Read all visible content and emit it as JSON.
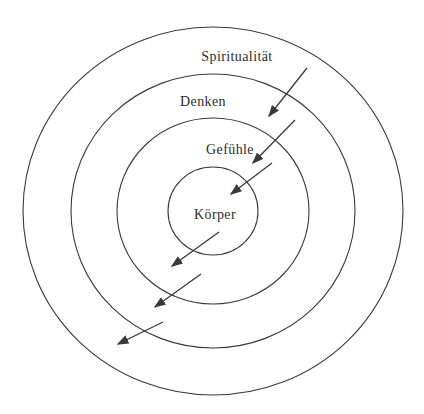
{
  "diagram": {
    "type": "concentric-rings",
    "background_color": "#ffffff",
    "stroke_color": "#3a3a3a",
    "text_color": "#2d2d2d",
    "center": {
      "x": 213,
      "y": 211
    },
    "rings": [
      {
        "id": "spiritualitaet",
        "label": "Spiritualität",
        "rx": 190,
        "ry": 184,
        "label_x": 237,
        "label_y": 61
      },
      {
        "id": "denken",
        "label": "Denken",
        "rx": 142,
        "ry": 137,
        "label_x": 203,
        "label_y": 106
      },
      {
        "id": "gefuehle",
        "label": "Gefühle",
        "rx": 96,
        "ry": 93,
        "label_x": 230,
        "label_y": 154
      },
      {
        "id": "koerper",
        "label": "Körper",
        "rx": 45,
        "ry": 44,
        "label_x": 215,
        "label_y": 219
      }
    ],
    "arrows": [
      {
        "direction": "inward",
        "x1": 307,
        "y1": 68,
        "x2": 269,
        "y2": 116
      },
      {
        "direction": "inward",
        "x1": 295,
        "y1": 120,
        "x2": 253,
        "y2": 163
      },
      {
        "direction": "inward",
        "x1": 272,
        "y1": 163,
        "x2": 231,
        "y2": 194
      },
      {
        "direction": "outward",
        "x1": 219,
        "y1": 232,
        "x2": 172,
        "y2": 266
      },
      {
        "direction": "outward",
        "x1": 201,
        "y1": 274,
        "x2": 155,
        "y2": 307
      },
      {
        "direction": "outward",
        "x1": 163,
        "y1": 322,
        "x2": 118,
        "y2": 344
      }
    ]
  }
}
